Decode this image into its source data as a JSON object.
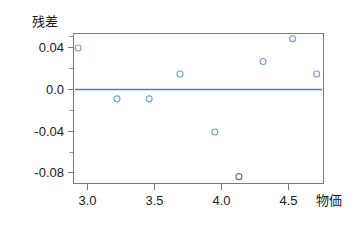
{
  "chart_data": {
    "type": "scatter",
    "title": "",
    "subtitle": "",
    "xlabel": "物価",
    "ylabel": "残差",
    "xlim": [
      2.82,
      4.78
    ],
    "ylim": [
      -0.098,
      0.058
    ],
    "grid": false,
    "legend": null,
    "xticks": [
      "3.0",
      "3.5",
      "4.0",
      "4.5"
    ],
    "xtick_values": [
      3.0,
      3.5,
      4.0,
      4.5
    ],
    "yticks": [
      "0.04",
      "0.0",
      "-0.04",
      "-0.08"
    ],
    "ytick_values": [
      0.04,
      0.0,
      -0.04,
      -0.08
    ],
    "reference_line": {
      "name": "zero-residual-line",
      "y": 0.0,
      "color": "#4a7ebb"
    },
    "marker": {
      "shape": "open-circle",
      "color": "#6f9fd8",
      "outlier_color": "#6b6b78",
      "radius": 3
    },
    "points": [
      {
        "x": 2.93,
        "y": 0.04,
        "color": "#6f9fd8"
      },
      {
        "x": 3.22,
        "y": -0.009,
        "color": "#6f9fd8"
      },
      {
        "x": 3.46,
        "y": -0.009,
        "color": "#6f9fd8"
      },
      {
        "x": 3.69,
        "y": 0.015,
        "color": "#6f9fd8"
      },
      {
        "x": 3.95,
        "y": -0.041,
        "color": "#6f9fd8"
      },
      {
        "x": 4.13,
        "y": -0.084,
        "color": "#6b6b78"
      },
      {
        "x": 4.31,
        "y": 0.027,
        "color": "#6f9fd8"
      },
      {
        "x": 4.53,
        "y": 0.049,
        "color": "#6f9fd8"
      },
      {
        "x": 4.71,
        "y": 0.015,
        "color": "#6f9fd8"
      }
    ]
  },
  "axes": {
    "y_axis_title": "残差",
    "x_axis_title": "物価",
    "frame_color": "#7a7a7a"
  },
  "labels": {
    "y0": "0.04",
    "y1": "0.0",
    "y2": "-0.04",
    "y3": "-0.08",
    "x0": "3.0",
    "x1": "3.5",
    "x2": "4.0",
    "x3": "4.5"
  }
}
